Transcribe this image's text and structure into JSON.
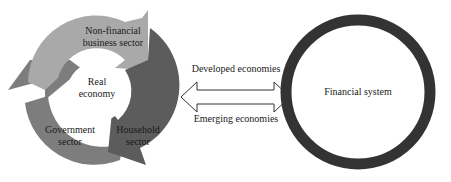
{
  "real_economy_cycle": {
    "center_label_line1": "Real",
    "center_label_line2": "economy",
    "sectors": [
      {
        "line1": "Non-financial",
        "line2": "business sector",
        "color": "#a9a9a9"
      },
      {
        "line1": "Household",
        "line2": "sector",
        "color": "#5c5c5c"
      },
      {
        "line1": "Government",
        "line2": "sector",
        "color": "#7d7d7d"
      }
    ]
  },
  "connector": {
    "top_label": "Developed economies",
    "bottom_label": "Emerging economies",
    "type": "double-headed-arrow"
  },
  "financial_system": {
    "label": "Financial system",
    "ring_color": "#333333"
  }
}
